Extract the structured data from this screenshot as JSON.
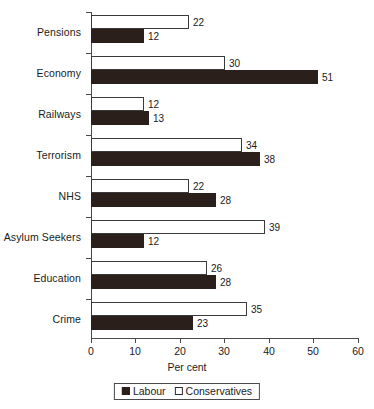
{
  "chart_data": {
    "type": "bar",
    "orientation": "horizontal",
    "title": "",
    "xlabel": "Per cent",
    "ylabel": "",
    "xlim": [
      0,
      60
    ],
    "xticks": [
      0,
      10,
      20,
      30,
      40,
      50,
      60
    ],
    "grid": false,
    "legend_position": "bottom",
    "categories": [
      "Pensions",
      "Economy",
      "Railways",
      "Terrorism",
      "NHS",
      "Asylum Seekers",
      "Education",
      "Crime"
    ],
    "series": [
      {
        "name": "Conservatives",
        "color": "#ffffff",
        "values": [
          22,
          30,
          12,
          34,
          22,
          39,
          26,
          35
        ]
      },
      {
        "name": "Labour",
        "color": "#2b1f1b",
        "values": [
          12,
          51,
          13,
          38,
          28,
          12,
          28,
          23
        ]
      }
    ]
  },
  "legend": {
    "items": [
      {
        "label": "Labour",
        "swatch": "filled-square-icon"
      },
      {
        "label": "Conservatives",
        "swatch": "open-square-icon"
      }
    ]
  },
  "axis": {
    "x_title": "Per cent",
    "tick_labels": [
      "0",
      "10",
      "20",
      "30",
      "40",
      "50",
      "60"
    ]
  },
  "values_text": {
    "conservatives": [
      "22",
      "30",
      "12",
      "34",
      "22",
      "39",
      "26",
      "35"
    ],
    "labour": [
      "12",
      "51",
      "13",
      "38",
      "28",
      "12",
      "28",
      "23"
    ]
  }
}
